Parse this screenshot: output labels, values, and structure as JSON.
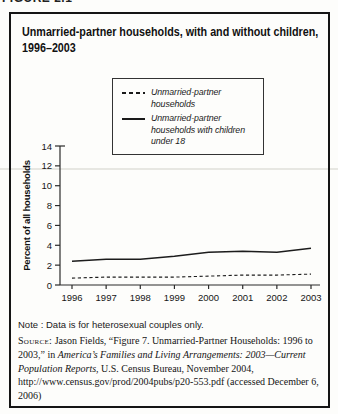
{
  "page": {
    "figure_label": "FIGURE 2.1"
  },
  "panel": {
    "title_lines": [
      "Unmarried-partner households, with and without children,",
      "1996–2003"
    ]
  },
  "legend": {
    "items": [
      {
        "label": "Unmarried-partner households",
        "style": "dashed"
      },
      {
        "label": "Unmarried-partner households with children under 18",
        "style": "solid"
      }
    ]
  },
  "chart_data": {
    "type": "line",
    "x": [
      1996,
      1997,
      1998,
      1999,
      2000,
      2001,
      2002,
      2003
    ],
    "series": [
      {
        "name": "Unmarried-partner households",
        "style": "dashed",
        "values": [
          0.7,
          0.8,
          0.8,
          0.8,
          0.9,
          1.0,
          1.0,
          1.1
        ]
      },
      {
        "name": "Unmarried-partner households with children under 18",
        "style": "solid",
        "values": [
          2.4,
          2.6,
          2.6,
          2.9,
          3.3,
          3.4,
          3.3,
          3.7
        ]
      }
    ],
    "title": "Unmarried-partner households, with and without children, 1996–2003",
    "xlabel": "",
    "ylabel": "Percent of all households",
    "ylim": [
      0,
      14
    ],
    "yticks": [
      0,
      2,
      4,
      6,
      8,
      10,
      12,
      14
    ],
    "grid": false,
    "legend_position": "top-center"
  },
  "note": "Note : Data is for heterosexual couples only.",
  "source": {
    "parts": [
      {
        "style": "smallcaps",
        "text": "Source:"
      },
      {
        "style": "normal",
        "text": " Jason Fields, “Figure 7. Unmarried-Partner Households: 1996 to 2003,” in "
      },
      {
        "style": "italic",
        "text": "America’s Families and Living Arrangements: 2003—Current Population Reports"
      },
      {
        "style": "normal",
        "text": ", U.S. Census Bureau, November 2004, http://www.census.gov/prod/2004pubs/p20-553.pdf (accessed December 6, 2006)"
      }
    ]
  }
}
